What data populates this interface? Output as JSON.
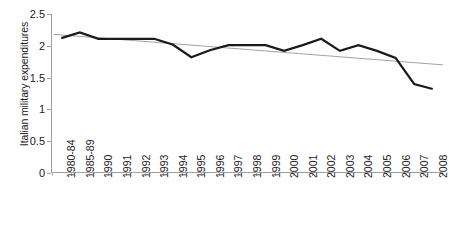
{
  "chart_data": {
    "type": "line",
    "title": "",
    "xlabel": "",
    "ylabel": "Italian military expenditures",
    "ylim": [
      0,
      2.5
    ],
    "ytick_labels": [
      "0",
      "0.5",
      "1",
      "1.5",
      "2",
      "2.5"
    ],
    "ytick_values": [
      0,
      0.5,
      1,
      1.5,
      2,
      2.5
    ],
    "grid": false,
    "legend": "none",
    "categories": [
      "1980-84",
      "1985-89",
      "1990",
      "1991",
      "1992",
      "1993",
      "1994",
      "1995",
      "1996",
      "1997",
      "1998",
      "1999",
      "2000",
      "2001",
      "2002",
      "2003",
      "2004",
      "2005",
      "2006",
      "2007",
      "2008"
    ],
    "series": [
      {
        "name": "Italian military expenditures",
        "type": "line",
        "color": "#1a1a1a",
        "width": 2.2,
        "values": [
          2.12,
          2.21,
          2.11,
          2.11,
          2.11,
          2.11,
          2.02,
          1.82,
          1.93,
          2.01,
          2.01,
          2.01,
          1.92,
          2.01,
          2.11,
          1.92,
          2.01,
          1.92,
          1.81,
          1.4,
          1.32
        ]
      },
      {
        "name": "Linear trendline",
        "type": "trendline",
        "color": "#999999",
        "width": 0.9,
        "endpoints": [
          2.18,
          1.7
        ]
      }
    ],
    "annotations": []
  },
  "axes": {
    "y_axis_label": "Italian military expenditures",
    "axis_color": "#9e9e9e"
  }
}
